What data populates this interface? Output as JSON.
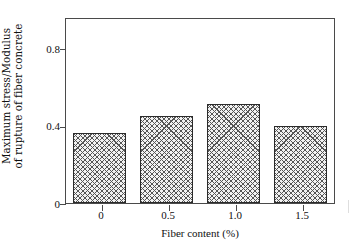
{
  "chart_data": {
    "type": "bar",
    "title": "",
    "categories": [
      "0",
      "0.5",
      "1.0",
      "1.5"
    ],
    "values": [
      0.36,
      0.45,
      0.51,
      0.4
    ],
    "xlabel": "Fiber content (%)",
    "ylabel_lines": [
      "Maximum stress/Modulus",
      "of rupture of fiber concrete"
    ],
    "ylabel": "Maximum stress/Modulus of rupture of fiber concrete",
    "ytick_labels": [
      "0",
      "0.4",
      "0.8"
    ],
    "ytick_values": [
      0,
      0.4,
      0.8
    ],
    "ylim": [
      0,
      0.96
    ],
    "xtick_labels": [
      "0",
      "0.5",
      "1.0",
      "1.5"
    ],
    "grid": false,
    "legend": null,
    "bar_fill": "crosshatch",
    "colors": {
      "axis": "#4a4a4a",
      "bar_edge": "#2b2b2b",
      "bar_hatch": "#555555",
      "bar_face": "#f2f2f2",
      "background": "#ffffff",
      "text": "#111111"
    }
  }
}
